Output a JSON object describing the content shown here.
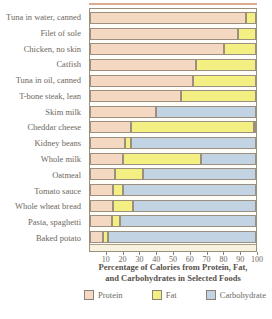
{
  "chart_data": {
    "type": "bar",
    "stacked": true,
    "orientation": "horizontal",
    "title_line1": "Percentage of Calories from Protein, Fat,",
    "title_line2": "and Carbohydrates in Selected Foods",
    "xlim": [
      0,
      100
    ],
    "xticks": [
      10,
      20,
      30,
      40,
      50,
      60,
      70,
      80,
      90,
      100
    ],
    "grid": false,
    "legend_position": "bottom",
    "categories": [
      "Tuna in water, canned",
      "Filet of sole",
      "Chicken, no skin",
      "Catfish",
      "Tuna in oil, canned",
      "T-bone steak, lean",
      "Skim milk",
      "Cheddar cheese",
      "Kidney beans",
      "Whole milk",
      "Oatmeal",
      "Tomato sauce",
      "Whole wheat bread",
      "Pasta, spaghetti",
      "Baked potato"
    ],
    "series": [
      {
        "name": "Protein",
        "color": "#f4d8c2",
        "values": [
          94,
          89,
          81,
          64,
          62,
          55,
          40,
          25,
          21,
          20,
          15,
          14,
          14,
          13,
          8
        ]
      },
      {
        "name": "Fat",
        "color": "#f4ef82",
        "values": [
          6,
          11,
          19,
          36,
          38,
          45,
          0,
          74,
          4,
          47,
          17,
          6,
          12,
          5,
          3
        ]
      },
      {
        "name": "Carbohydrate",
        "color": "#c2d4e4",
        "values": [
          0,
          0,
          0,
          0,
          0,
          0,
          60,
          1,
          75,
          33,
          68,
          80,
          74,
          82,
          89
        ]
      }
    ]
  },
  "colors": {
    "segment_border": "#9b9080",
    "plot_border": "#9a8f7c",
    "axis_strip": "#f7f2dd",
    "top_rule": "#dca98c",
    "text": "#6e6861",
    "title_text": "#57524b"
  }
}
